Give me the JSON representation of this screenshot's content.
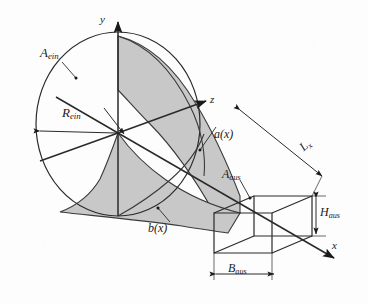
{
  "figure": {
    "kind": "technical-line-drawing",
    "background_color": "#fdfdfd",
    "line_color": "#1a1a1a",
    "surface_fill_color": "#c8c8c8"
  },
  "axes": {
    "x_label": "x",
    "y_label": "y",
    "z_label": "z"
  },
  "labels": {
    "inlet_area": {
      "base": "A",
      "sub": "ein"
    },
    "inlet_radius": {
      "base": "R",
      "sub": "ein"
    },
    "outlet_area": {
      "base": "A",
      "sub": "aus"
    },
    "outlet_height": {
      "base": "H",
      "sub": "aus"
    },
    "outlet_width": {
      "base": "B",
      "sub": "aus"
    },
    "duct_length": {
      "base": "L",
      "sub": "x"
    },
    "width_function": "a(x)",
    "height_function": "b(x)"
  }
}
